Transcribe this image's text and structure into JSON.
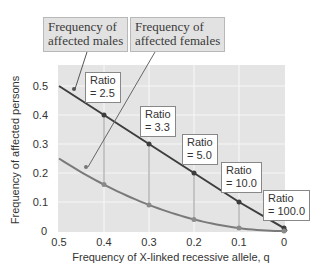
{
  "chart_data": {
    "type": "line",
    "title": "",
    "xlabel": "Frequency of X-linked recessive allele, q",
    "ylabel": "Frequency of affected persons",
    "x": [
      0.5,
      0.4,
      0.3,
      0.2,
      0.1,
      0.0
    ],
    "x_ticks": [
      "0.5",
      "0.4",
      "0.3",
      "0.2",
      "0.1",
      "0"
    ],
    "y_ticks": [
      "0",
      "0.1",
      "0.2",
      "0.3",
      "0.4",
      "0.5"
    ],
    "xlim": [
      0.5,
      0
    ],
    "ylim": [
      0,
      0.5
    ],
    "x_reversed": true,
    "grid": true,
    "series": [
      {
        "name": "Frequency of affected males",
        "values": [
          0.5,
          0.4,
          0.3,
          0.2,
          0.1,
          0.01
        ],
        "color": "#3d3d3d"
      },
      {
        "name": "Frequency of affected females",
        "values": [
          0.25,
          0.16,
          0.09,
          0.04,
          0.01,
          0.0001
        ],
        "color": "#7a7a7a"
      }
    ],
    "annotations": [
      {
        "text": "Ratio = 2.5",
        "q": 0.4
      },
      {
        "text": "Ratio = 3.3",
        "q": 0.3
      },
      {
        "text": "Ratio = 5.0",
        "q": 0.2
      },
      {
        "text": "Ratio = 10.0",
        "q": 0.1
      },
      {
        "text": "Ratio = 100.0",
        "q": 0.01
      }
    ],
    "legend_position": "callouts-top"
  },
  "callouts": {
    "males": {
      "line1": "Frequency of",
      "line2": "affected males"
    },
    "females": {
      "line1": "Frequency of",
      "line2": "affected females"
    }
  },
  "ratios": [
    {
      "label": "Ratio",
      "value": "= 2.5"
    },
    {
      "label": "Ratio",
      "value": "= 3.3"
    },
    {
      "label": "Ratio",
      "value": "= 5.0"
    },
    {
      "label": "Ratio",
      "value": "= 10.0"
    },
    {
      "label": "Ratio",
      "value": "= 100.0"
    }
  ]
}
